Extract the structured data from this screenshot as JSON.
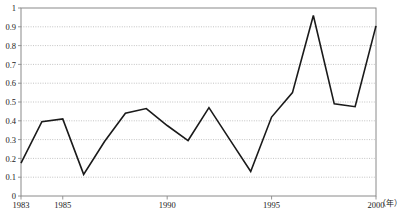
{
  "chart_data": {
    "type": "line",
    "title": "",
    "xlabel": "年",
    "ylabel": "",
    "x": [
      1983,
      1984,
      1985,
      1986,
      1987,
      1988,
      1989,
      1990,
      1991,
      1992,
      1993,
      1994,
      1995,
      1996,
      1997,
      1998,
      1999,
      2000
    ],
    "values": [
      0.175,
      0.395,
      0.41,
      0.115,
      0.29,
      0.44,
      0.465,
      0.375,
      0.295,
      0.47,
      0.3,
      0.13,
      0.42,
      0.55,
      0.96,
      0.49,
      0.475,
      0.905
    ],
    "series": [
      {
        "name": "",
        "values": [
          0.175,
          0.395,
          0.41,
          0.115,
          0.29,
          0.44,
          0.465,
          0.375,
          0.295,
          0.47,
          0.3,
          0.13,
          0.42,
          0.55,
          0.96,
          0.49,
          0.475,
          0.905
        ]
      }
    ],
    "xlim": [
      1983,
      2000
    ],
    "ylim": [
      0,
      1
    ],
    "ytick_labels": [
      "0",
      "0.1",
      "0.2",
      "0.3",
      "0.4",
      "0.5",
      "0.6",
      "0.7",
      "0.8",
      "0.9",
      "1"
    ],
    "ytick_values": [
      0,
      0.1,
      0.2,
      0.3,
      0.4,
      0.5,
      0.6,
      0.7,
      0.8,
      0.9,
      1
    ],
    "xtick_labels": [
      "1983",
      "1985",
      "1990",
      "1995",
      "2000"
    ],
    "xtick_values": [
      1983,
      1985,
      1990,
      1995,
      2000
    ],
    "grid": true,
    "grid_axis": "y",
    "grid_style": "dotted",
    "legend": false,
    "legend_position": "none",
    "line_color": "#1a1a1a",
    "grid_color": "#b4b4b4",
    "axis_color": "#808080",
    "background": "#ffffff"
  },
  "axis": {
    "x_unit_label": "（年）"
  },
  "footnote": {
    "text": ""
  }
}
